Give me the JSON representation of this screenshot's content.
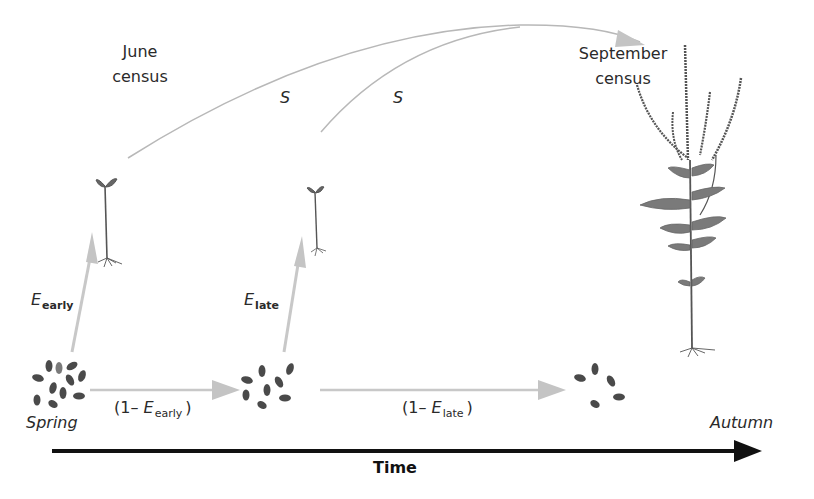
{
  "diagram": {
    "type": "life-cycle-timeline",
    "colors": {
      "arrow_gray": "#c4c4c4",
      "curve_gray": "#b8b8b8",
      "timeline": "#111111",
      "seed": "#4a4a4a",
      "plant": "#5a5a5a",
      "text": "#2a2a2a"
    },
    "labels": {
      "june_census_line1": "June",
      "june_census_line2": "census",
      "september_census_line1": "September",
      "september_census_line2": "census",
      "survival_1": "S",
      "survival_2": "S",
      "emergence_early_main": "E",
      "emergence_early_sub": "early",
      "emergence_late_main": "E",
      "emergence_late_sub": "late",
      "non_emergence_early_open": "(1– ",
      "non_emergence_early_main": "E",
      "non_emergence_early_sub": "early",
      "non_emergence_early_close": ")",
      "non_emergence_late_open": "(1– ",
      "non_emergence_late_main": "E",
      "non_emergence_late_sub": "late",
      "non_emergence_late_close": ")",
      "spring": "Spring",
      "autumn": "Autumn",
      "time_axis": "Time"
    },
    "nodes": [
      {
        "id": "seeds-spring",
        "kind": "seed-cluster",
        "count": 11
      },
      {
        "id": "seedling-early",
        "kind": "seedling"
      },
      {
        "id": "seeds-mid",
        "kind": "seed-cluster",
        "count": 8
      },
      {
        "id": "seedling-late",
        "kind": "seedling"
      },
      {
        "id": "seeds-autumn",
        "kind": "seed-cluster",
        "count": 5
      },
      {
        "id": "mature-plant",
        "kind": "flowering-ragweed-plant"
      }
    ],
    "edges": [
      {
        "from": "seeds-spring",
        "to": "seedling-early",
        "label": "E_early"
      },
      {
        "from": "seeds-spring",
        "to": "seeds-mid",
        "label": "(1– E_early)"
      },
      {
        "from": "seeds-mid",
        "to": "seedling-late",
        "label": "E_late"
      },
      {
        "from": "seeds-mid",
        "to": "seeds-autumn",
        "label": "(1– E_late)"
      },
      {
        "from": "seedling-early",
        "to": "mature-plant",
        "label": "S"
      },
      {
        "from": "seedling-late",
        "to": "mature-plant",
        "label": "S"
      }
    ]
  }
}
